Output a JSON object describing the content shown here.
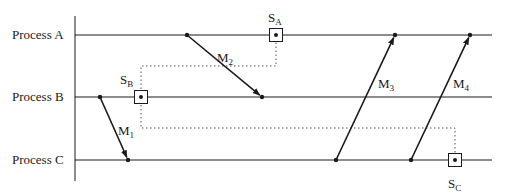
{
  "diagram": {
    "type": "space-time diagram (distributed snapshot)",
    "processes": [
      {
        "id": "A",
        "label": "Process A",
        "y": 35
      },
      {
        "id": "B",
        "label": "Process B",
        "y": 97
      },
      {
        "id": "C",
        "label": "Process C",
        "y": 160
      }
    ],
    "axis": {
      "x": 75,
      "top": 16,
      "bottom": 181
    },
    "timeline_end_x": 492,
    "messages": [
      {
        "id": "M1",
        "label": "M",
        "sub": "1",
        "from": [
          100,
          97
        ],
        "to": [
          128,
          160
        ],
        "label_pos": [
          118,
          135
        ]
      },
      {
        "id": "M2",
        "label": "M",
        "sub": "2",
        "from": [
          187,
          35
        ],
        "to": [
          262,
          97
        ],
        "label_pos": [
          217,
          62
        ]
      },
      {
        "id": "M3",
        "label": "M",
        "sub": "3",
        "from": [
          336,
          160
        ],
        "to": [
          395,
          35
        ],
        "label_pos": [
          378,
          88
        ]
      },
      {
        "id": "M4",
        "label": "M",
        "sub": "4",
        "from": [
          411,
          160
        ],
        "to": [
          470,
          35
        ],
        "label_pos": [
          453,
          88
        ]
      }
    ],
    "snapshots": [
      {
        "id": "SA",
        "label": "S",
        "sub": "A",
        "x": 276,
        "y": 35,
        "label_pos": [
          268,
          22
        ]
      },
      {
        "id": "SB",
        "label": "S",
        "sub": "B",
        "x": 141,
        "y": 97,
        "label_pos": [
          120,
          84
        ]
      },
      {
        "id": "SC",
        "label": "S",
        "sub": "C",
        "x": 455,
        "y": 160,
        "label_pos": [
          448,
          188
        ]
      }
    ],
    "cuts": [
      {
        "points": [
          [
            141,
            97
          ],
          [
            141,
            66
          ],
          [
            276,
            66
          ],
          [
            276,
            35
          ]
        ]
      },
      {
        "points": [
          [
            141,
            97
          ],
          [
            141,
            128
          ],
          [
            455,
            128
          ],
          [
            455,
            160
          ]
        ]
      }
    ],
    "event_dots": [
      [
        100,
        97
      ],
      [
        128,
        160
      ],
      [
        187,
        35
      ],
      [
        262,
        97
      ],
      [
        336,
        160
      ],
      [
        395,
        35
      ],
      [
        411,
        160
      ],
      [
        470,
        35
      ]
    ],
    "colors": {
      "line": "#1a1a1a",
      "cut": "#555555",
      "background": "#ffffff"
    }
  }
}
